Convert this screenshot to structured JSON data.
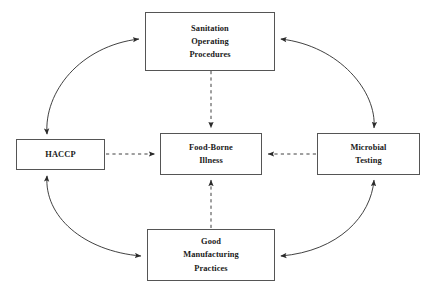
{
  "diagram": {
    "type": "cycle-with-central-outcome",
    "background_color": "#ffffff",
    "stroke_color": "#555555",
    "text_color": "#1a1a1a",
    "nodes": [
      {
        "id": "sanitation",
        "label": "Sanitation\nOperating\nProcedures",
        "position": "top"
      },
      {
        "id": "haccp",
        "label": "HACCP",
        "position": "left"
      },
      {
        "id": "illness",
        "label": "Food-Borne\nIllness",
        "position": "center"
      },
      {
        "id": "microbial",
        "label": "Microbial\nTesting",
        "position": "right"
      },
      {
        "id": "gmp",
        "label": "Good\nManufacturing\nPractices",
        "position": "bottom"
      }
    ],
    "edges": [
      {
        "id": "haccp-sanitation",
        "from": "haccp",
        "to": "sanitation",
        "style": "curved",
        "heads": "both"
      },
      {
        "id": "sanitation-microbial",
        "from": "sanitation",
        "to": "microbial",
        "style": "curved",
        "heads": "both"
      },
      {
        "id": "haccp-gmp",
        "from": "haccp",
        "to": "gmp",
        "style": "curved",
        "heads": "both"
      },
      {
        "id": "gmp-microbial",
        "from": "gmp",
        "to": "microbial",
        "style": "curved",
        "heads": "both"
      },
      {
        "id": "sanitation-illness",
        "from": "sanitation",
        "to": "illness",
        "style": "dashed",
        "heads": "end"
      },
      {
        "id": "haccp-illness",
        "from": "haccp",
        "to": "illness",
        "style": "dashed",
        "heads": "end"
      },
      {
        "id": "microbial-illness",
        "from": "microbial",
        "to": "illness",
        "style": "dashed",
        "heads": "end"
      },
      {
        "id": "gmp-illness",
        "from": "gmp",
        "to": "illness",
        "style": "dashed",
        "heads": "end"
      }
    ]
  }
}
